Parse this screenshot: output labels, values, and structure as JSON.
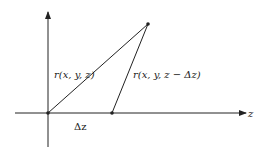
{
  "diagram": {
    "axis_label": "z",
    "label_r1": "r(x, y, z)",
    "label_r2": "r(x, y, z − Δz)",
    "label_dz": "Δz",
    "colors": {
      "line": "#222222",
      "background": "#ffffff"
    }
  }
}
